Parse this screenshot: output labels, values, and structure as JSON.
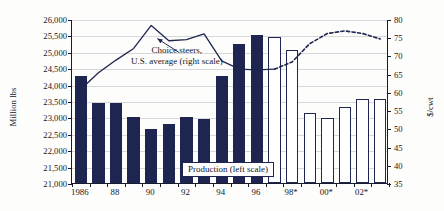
{
  "chart_data": {
    "type": "bar",
    "title": "",
    "subtitle": "",
    "xlabel": "",
    "ylabel": "Million lbs",
    "y2label": "$/cwt",
    "ylim": [
      21000,
      26000
    ],
    "y2lim": [
      35,
      80
    ],
    "grid": true,
    "legend_position": "inside",
    "x": [
      1986,
      1987,
      1988,
      1989,
      1990,
      1991,
      1992,
      1993,
      1994,
      1995,
      1996,
      1997,
      1998,
      1999,
      2000,
      2001,
      2002,
      2003
    ],
    "categories": [
      "1986",
      "87",
      "88",
      "89",
      "90",
      "91",
      "92",
      "93",
      "94",
      "95",
      "96",
      "97",
      "98*",
      "99*",
      "00*",
      "01*",
      "02*",
      "03*"
    ],
    "tick_labels": [
      {
        "category": "1986",
        "label": "1986"
      },
      {
        "category": "88",
        "label": "88"
      },
      {
        "category": "90",
        "label": "90"
      },
      {
        "category": "92",
        "label": "92"
      },
      {
        "category": "94",
        "label": "94"
      },
      {
        "category": "96",
        "label": "96"
      },
      {
        "category": "98*",
        "label": "98*"
      },
      {
        "category": "00*",
        "label": "00*"
      },
      {
        "category": "02*",
        "label": "02*"
      }
    ],
    "y_ticks": [
      "21,000",
      "21,500",
      "22,000",
      "22,500",
      "23,000",
      "23,500",
      "24,000",
      "24,500",
      "25,000",
      "25,500",
      "26,000"
    ],
    "y_tick_values": [
      21000,
      21500,
      22000,
      22500,
      23000,
      23500,
      24000,
      24500,
      25000,
      25500,
      26000
    ],
    "y2_ticks": [
      "35",
      "40",
      "45",
      "50",
      "55",
      "60",
      "65",
      "70",
      "75",
      "80"
    ],
    "y2_tick_values": [
      35,
      40,
      45,
      50,
      55,
      60,
      65,
      70,
      75,
      80
    ],
    "series": [
      {
        "name": "Production (left scale)",
        "type": "bar",
        "axis": "left",
        "color": "#1d2550",
        "forecast_color": "#ffffff",
        "forecast_from": "98*",
        "values": [
          24250,
          23440,
          23440,
          23000,
          22650,
          22800,
          23010,
          22960,
          24270,
          25230,
          25500,
          25460,
          25070,
          23140,
          22980,
          23330,
          23570,
          23570
        ],
        "styles": [
          "filled",
          "filled",
          "filled",
          "filled",
          "filled",
          "filled",
          "filled",
          "filled",
          "filled",
          "filled",
          "filled",
          "hollow",
          "hollow",
          "hollow",
          "hollow",
          "hollow",
          "hollow",
          "hollow"
        ]
      },
      {
        "name": "Choice steers, U.S. average (right scale)",
        "type": "line",
        "axis": "right",
        "color": "#1d2550",
        "dashed_from": "98*",
        "values": [
          61.0,
          65.5,
          69.0,
          72.2,
          78.5,
          74.3,
          74.6,
          76.2,
          68.8,
          66.5,
          66.3,
          66.5,
          68.5,
          73.5,
          76.3,
          77.0,
          76.3,
          74.8
        ]
      }
    ],
    "annotations": [
      {
        "name": "line-series-label",
        "line1": "Choice steers,",
        "line2": "U.S. average (right scale)",
        "arrow": true
      },
      {
        "name": "bar-series-label",
        "text": "Production (left scale)",
        "boxed": true
      }
    ],
    "colors": {
      "bar_fill": "#1d2550",
      "bar_forecast_fill": "#ffffff",
      "line": "#1d2550",
      "axis": "#1b1b2e",
      "grid": "#d8d8dc",
      "background": "#fdfdfb",
      "text": "#15151f"
    }
  }
}
